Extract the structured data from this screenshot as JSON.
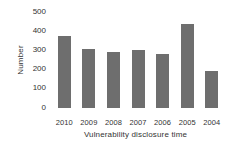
{
  "chart_data": {
    "type": "bar",
    "title": "",
    "xlabel": "Vulnerability disclosure time",
    "ylabel": "Number",
    "categories": [
      "2010",
      "2009",
      "2008",
      "2007",
      "2006",
      "2005",
      "2004"
    ],
    "values": [
      375,
      305,
      290,
      300,
      280,
      440,
      195
    ],
    "ylim": [
      0,
      500
    ],
    "yticks": [
      500,
      400,
      300,
      200,
      100,
      0
    ],
    "ytick_labels": [
      "500",
      "400",
      "300",
      "200",
      "100",
      "0"
    ],
    "grid": false,
    "legend": null,
    "series": [
      {
        "name": "Number",
        "values": [
          375,
          305,
          290,
          300,
          280,
          440,
          195
        ]
      }
    ],
    "colors": {
      "bar": "#6e6e6e",
      "text": "#333333",
      "background": "#ffffff"
    }
  }
}
